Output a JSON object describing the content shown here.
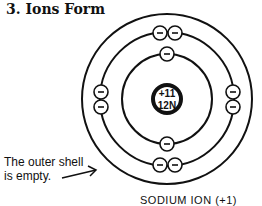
{
  "title": "3. Ions Form",
  "nucleus": {
    "charge": "+11",
    "neutrons": "12N"
  },
  "shells": [
    {
      "name": "inner",
      "electrons": 2
    },
    {
      "name": "middle",
      "electrons": 8
    },
    {
      "name": "outer",
      "electrons": 0
    }
  ],
  "electron_symbol": "−",
  "annotation": {
    "line1": "The outer shell",
    "line2": "is empty."
  },
  "caption": "SODIUM ION (+1)"
}
